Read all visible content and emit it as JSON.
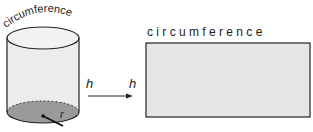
{
  "diagram": {
    "cylinder_label": "circumference",
    "rectangle_top_label": "c i r c u m f e r e n c e",
    "height_label_cylinder": "h",
    "height_label_rectangle": "h",
    "radius_label": "r"
  },
  "colors": {
    "cylinder_side": "#ebebeb",
    "cylinder_base": "#9a9a9a",
    "rectangle_fill": "#e6e6e6",
    "stroke": "#222222"
  }
}
